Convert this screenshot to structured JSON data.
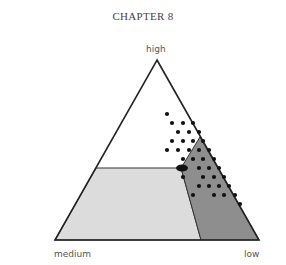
{
  "header": {
    "title": "CHAPTER 8"
  },
  "diagram": {
    "type": "ternary",
    "vertices": {
      "top": "high",
      "bottom_left": "medium",
      "bottom_right": "low"
    },
    "regions": [
      {
        "name": "light-region",
        "color": "#dcdcdc"
      },
      {
        "name": "dark-region",
        "color": "#8e8e8e"
      }
    ],
    "colors": {
      "outline": "#222222",
      "dot": "#111111",
      "region_border": "#333333"
    }
  }
}
